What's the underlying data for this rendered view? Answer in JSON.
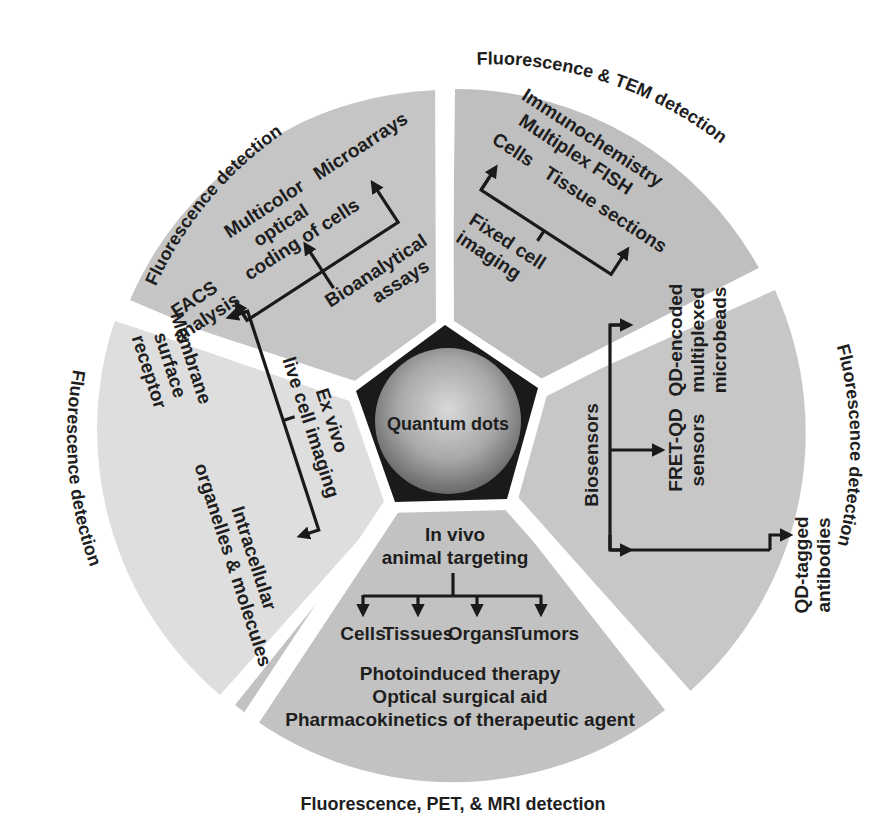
{
  "center": {
    "label": "Quantum dots"
  },
  "colors": {
    "background": "#ffffff",
    "segment_top_left": "#c5c5c5",
    "segment_top_right": "#bfbfbf",
    "segment_right": "#c7c7c7",
    "segment_bottom": "#c2c2c2",
    "segment_left": "#dedede",
    "pentagon": "#1a1a1a",
    "text": "#1e1e1e"
  },
  "segments": [
    {
      "id": "top-left",
      "detection": "Fluorescence detection",
      "root": [
        "Bioanalytical",
        "assays"
      ],
      "branches": [
        [
          "FACS",
          "analysis"
        ],
        [
          "Multicolor",
          "optical",
          "coding of cells"
        ],
        [
          "Microarrays"
        ]
      ]
    },
    {
      "id": "top-right",
      "detection": "Fluorescence & TEM detection",
      "root": [
        "Fixed cell",
        "imaging"
      ],
      "branches": [
        [
          "Cells"
        ],
        [
          "Tissue sections"
        ]
      ],
      "extra": [
        "Immunochemistry",
        "Multiplex FISH"
      ]
    },
    {
      "id": "right",
      "detection": "Fluorescence detection",
      "root": [
        "Biosensors"
      ],
      "branches": [
        [
          "QD-tagged",
          "antibodies"
        ],
        [
          "FRET-QD",
          "sensors"
        ],
        [
          "QD-encoded",
          "multiplexed",
          "microbeads"
        ]
      ]
    },
    {
      "id": "bottom",
      "detection": "Fluorescence, PET, & MRI detection",
      "root": [
        "In vivo",
        "animal targeting"
      ],
      "branches": [
        [
          "Cells"
        ],
        [
          "Tissues"
        ],
        [
          "Organs"
        ],
        [
          "Tumors"
        ]
      ],
      "extra": [
        "Photoinduced therapy",
        "Optical surgical aid",
        "Pharmacokinetics of therapeutic agent"
      ]
    },
    {
      "id": "left",
      "detection": "Fluorescence detection",
      "root": [
        "Ex vivo",
        "live cell imaging"
      ],
      "branches": [
        [
          "Membrane",
          "surface",
          "receptor"
        ],
        [
          "Intracellular",
          "organelles & molecules"
        ]
      ]
    }
  ]
}
